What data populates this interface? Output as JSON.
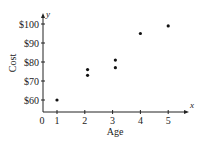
{
  "chart_data": {
    "type": "scatter",
    "title": "",
    "xlabel": "Age",
    "ylabel": "Cost",
    "x_axis_var": "x",
    "y_axis_var": "y",
    "origin_label": "0",
    "x_ticks": [
      1,
      2,
      3,
      4,
      5
    ],
    "x_tick_labels": [
      "1",
      "2",
      "3",
      "4",
      "5"
    ],
    "y_ticks": [
      60,
      70,
      80,
      90,
      100
    ],
    "y_tick_labels": [
      "$60",
      "$70",
      "$80",
      "$90",
      "$100"
    ],
    "xlim": [
      0,
      5.7
    ],
    "ylim": [
      53,
      103
    ],
    "grid": false,
    "legend": null,
    "points": [
      {
        "x": 1,
        "y": 60
      },
      {
        "x": 2.1,
        "y": 76
      },
      {
        "x": 2.1,
        "y": 73
      },
      {
        "x": 3.1,
        "y": 81
      },
      {
        "x": 3.1,
        "y": 77
      },
      {
        "x": 4,
        "y": 95
      },
      {
        "x": 5,
        "y": 99
      }
    ],
    "point_color": "#111111"
  }
}
